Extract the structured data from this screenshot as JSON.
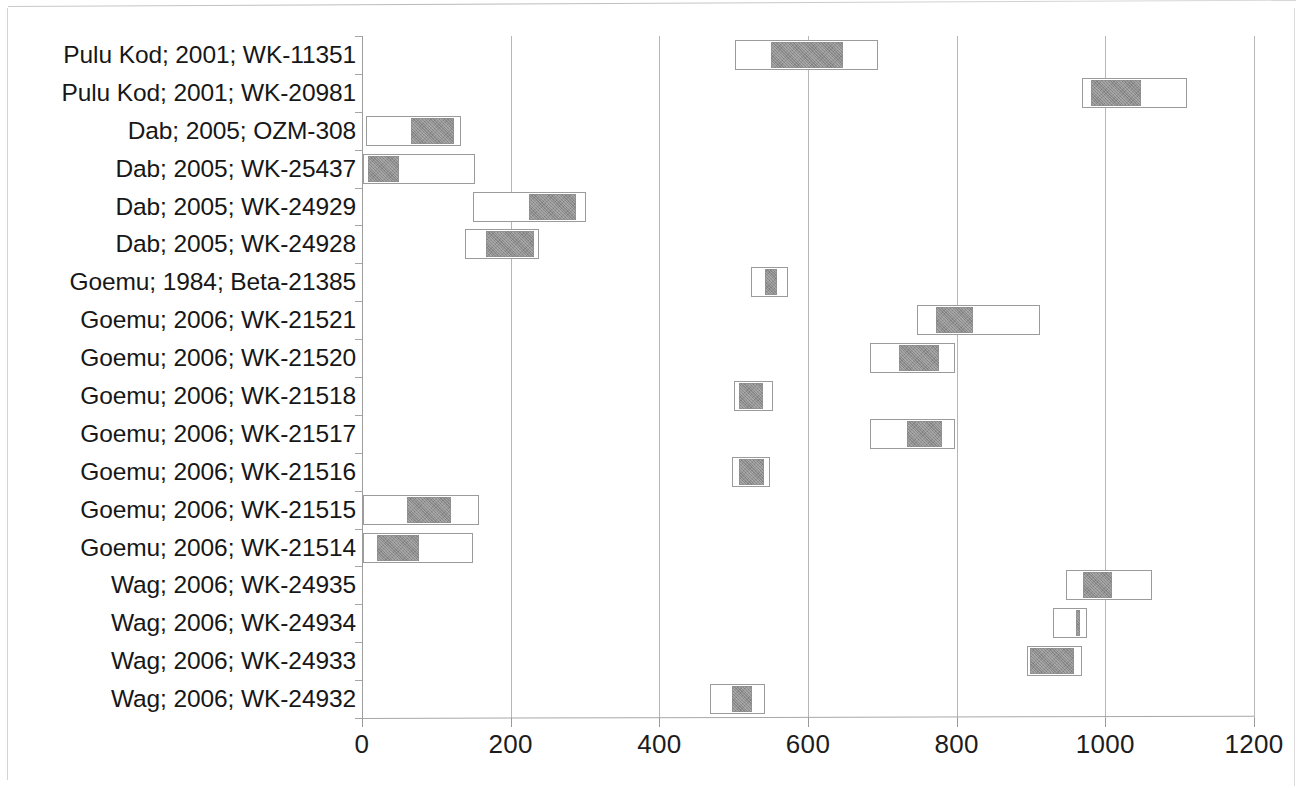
{
  "chart_data": {
    "type": "bar",
    "subtype": "floating-range-bar",
    "title": "",
    "subtitle": "",
    "xlabel": "",
    "ylabel": "",
    "xlim": [
      0,
      1200
    ],
    "ylim": null,
    "grid": true,
    "grid_axis": "x",
    "legend": null,
    "legend_position": "none",
    "orientation": "horizontal",
    "xticks": [
      0,
      200,
      400,
      600,
      800,
      1000,
      1200
    ],
    "xtick_labels": [
      "0",
      "200",
      "400",
      "600",
      "800",
      "1000",
      "1200"
    ],
    "colors": {
      "outer_range_fill": "#ffffff",
      "outer_range_border": "#9b9b9b",
      "inner_range_fill": "#8e8e8e",
      "gridline": "#b6b6b6",
      "axis": "#a8a8a8",
      "text": "#171717",
      "background": "#ffffff"
    },
    "series": [
      {
        "name": "outer_range",
        "description": "outer calibrated range (white bar)"
      },
      {
        "name": "inner_range",
        "description": "inner calibrated range (grey bar)"
      }
    ],
    "categories": [
      "Pulu Kod; 2001; WK-11351",
      "Pulu Kod; 2001; WK-20981",
      "Dab; 2005; OZM-308",
      "Dab; 2005; WK-25437",
      "Dab; 2005; WK-24929",
      "Dab; 2005; WK-24928",
      "Goemu; 1984; Beta-21385",
      "Goemu; 2006; WK-21521",
      "Goemu; 2006; WK-21520",
      "Goemu; 2006; WK-21518",
      "Goemu; 2006; WK-21517",
      "Goemu; 2006; WK-21516",
      "Goemu; 2006; WK-21515",
      "Goemu; 2006; WK-21514",
      "Wag; 2006; WK-24935",
      "Wag; 2006; WK-24934",
      "Wag; 2006; WK-24933",
      "Wag; 2006; WK-24932"
    ],
    "rows": [
      {
        "label": "Pulu Kod; 2001; WK-11351",
        "outer_start": 502,
        "outer_end": 694,
        "inner_start": 549,
        "inner_end": 646
      },
      {
        "label": "Pulu Kod; 2001; WK-20981",
        "outer_start": 968,
        "outer_end": 1110,
        "inner_start": 980,
        "inner_end": 1047
      },
      {
        "label": "Dab; 2005; OZM-308",
        "outer_start": 5,
        "outer_end": 133,
        "inner_start": 64,
        "inner_end": 122
      },
      {
        "label": "Dab; 2005; WK-25437",
        "outer_start": 1,
        "outer_end": 152,
        "inner_start": 7,
        "inner_end": 48
      },
      {
        "label": "Dab; 2005; WK-24929",
        "outer_start": 149,
        "outer_end": 301,
        "inner_start": 223,
        "inner_end": 287
      },
      {
        "label": "Dab; 2005; WK-24928",
        "outer_start": 139,
        "outer_end": 238,
        "inner_start": 165,
        "inner_end": 230
      },
      {
        "label": "Goemu; 1984; Beta-21385",
        "outer_start": 523,
        "outer_end": 573,
        "inner_start": 541,
        "inner_end": 557
      },
      {
        "label": "Goemu; 2006; WK-21521",
        "outer_start": 747,
        "outer_end": 912,
        "inner_start": 771,
        "inner_end": 821
      },
      {
        "label": "Goemu; 2006; WK-21520",
        "outer_start": 683,
        "outer_end": 798,
        "inner_start": 721,
        "inner_end": 775
      },
      {
        "label": "Goemu; 2006; WK-21518",
        "outer_start": 500,
        "outer_end": 553,
        "inner_start": 506,
        "inner_end": 538
      },
      {
        "label": "Goemu; 2006; WK-21517",
        "outer_start": 683,
        "outer_end": 798,
        "inner_start": 732,
        "inner_end": 779
      },
      {
        "label": "Goemu; 2006; WK-21516",
        "outer_start": 498,
        "outer_end": 549,
        "inner_start": 506,
        "inner_end": 540
      },
      {
        "label": "Goemu; 2006; WK-21515",
        "outer_start": 1,
        "outer_end": 157,
        "inner_start": 59,
        "inner_end": 118
      },
      {
        "label": "Goemu; 2006; WK-21514",
        "outer_start": 1,
        "outer_end": 149,
        "inner_start": 19,
        "inner_end": 75
      },
      {
        "label": "Wag; 2006; WK-24935",
        "outer_start": 947,
        "outer_end": 1063,
        "inner_start": 968,
        "inner_end": 1007
      },
      {
        "label": "Wag; 2006; WK-24934",
        "outer_start": 929,
        "outer_end": 976,
        "inner_start": 959,
        "inner_end": 965
      },
      {
        "label": "Wag; 2006; WK-24933",
        "outer_start": 894,
        "outer_end": 969,
        "inner_start": 897,
        "inner_end": 957
      },
      {
        "label": "Wag; 2006; WK-24932",
        "outer_start": 468,
        "outer_end": 542,
        "inner_start": 496,
        "inner_end": 523
      }
    ]
  }
}
